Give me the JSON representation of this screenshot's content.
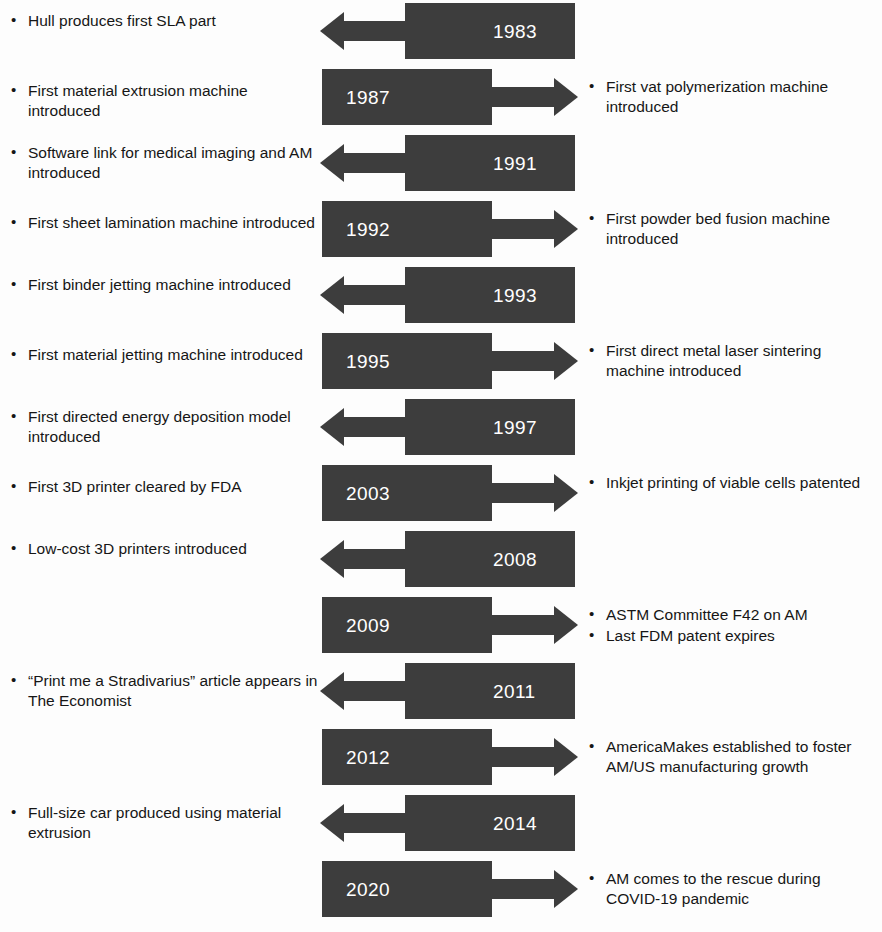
{
  "diagram": {
    "box_color": "#3d3d3d",
    "year_text_color": "#ffffff",
    "body_text_color": "#161616",
    "background": "#ffffff"
  },
  "rows": [
    {
      "year": "1983",
      "direction": "left",
      "left_items": [
        "Hull produces first SLA part"
      ],
      "right_items": []
    },
    {
      "year": "1987",
      "direction": "right",
      "left_items": [],
      "right_items": [
        "First vat polymerization machine introduced"
      ]
    },
    {
      "year": "1991",
      "direction": "left",
      "left_items": [
        "Software link for medical imaging and AM introduced"
      ],
      "right_items": []
    },
    {
      "year": "1992",
      "direction": "right",
      "left_items": [],
      "right_items": [
        "First powder bed fusion machine introduced"
      ]
    },
    {
      "year": "1993",
      "direction": "left",
      "left_items": [
        "First binder jetting machine introduced"
      ],
      "right_items": []
    },
    {
      "year": "1995",
      "direction": "right",
      "left_items": [],
      "right_items": [
        "First direct metal laser sintering machine introduced"
      ]
    },
    {
      "year": "1997",
      "direction": "left",
      "left_items": [
        "First directed energy deposition model introduced"
      ],
      "right_items": []
    },
    {
      "year": "2003",
      "direction": "right",
      "left_items": [],
      "right_items": [
        "Inkjet printing of viable cells patented"
      ]
    },
    {
      "year": "2008",
      "direction": "left",
      "left_items": [
        "Low-cost 3D printers introduced"
      ],
      "right_items": []
    },
    {
      "year": "2009",
      "direction": "right",
      "left_items": [],
      "right_items": [
        "ASTM Committee F42 on AM",
        "Last FDM patent expires"
      ]
    },
    {
      "year": "2011",
      "direction": "left",
      "left_items": [
        "“Print me a Stradivarius” article appears in The Economist"
      ],
      "right_items": []
    },
    {
      "year": "2012",
      "direction": "right",
      "left_items": [],
      "right_items": [
        "AmericaMakes established to foster AM/US manufacturing growth"
      ]
    },
    {
      "year": "2014",
      "direction": "left",
      "left_items": [
        "Full-size car produced using material extrusion"
      ],
      "right_items": []
    },
    {
      "year": "2020",
      "direction": "right",
      "left_items": [],
      "right_items": [
        "AM comes to the rescue during COVID-19 pandemic"
      ]
    }
  ],
  "extra_left_items": [
    {
      "after_row": 0,
      "text": "First material extrusion machine introduced"
    },
    {
      "after_row": 2,
      "text": "First sheet lamination machine introduced"
    },
    {
      "after_row": 4,
      "text": "First material jetting machine introduced"
    },
    {
      "after_row": 6,
      "text": "First 3D printer cleared by FDA"
    }
  ]
}
